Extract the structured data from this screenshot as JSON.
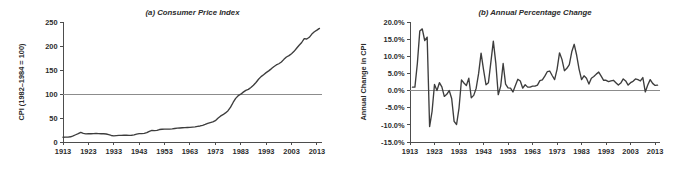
{
  "figure": {
    "background_color": "#ffffff",
    "line_color": "#3d3d3d",
    "axis_color": "#4d4d4d",
    "reference_line_color": "#8c8c8c"
  },
  "chart_data": [
    {
      "type": "line",
      "panel": "a",
      "title": "(a) Consumer Price Index",
      "xlabel": "",
      "ylabel": "CPI (1982–1984 = 100)",
      "xlim": [
        1913,
        2015
      ],
      "ylim": [
        0,
        250
      ],
      "xticks": [
        1913,
        1923,
        1933,
        1943,
        1953,
        1963,
        1973,
        1983,
        1993,
        2003,
        2013
      ],
      "xtick_labels": [
        "1913",
        "1923",
        "1933",
        "1943",
        "1953",
        "1963",
        "1973",
        "1983",
        "1993",
        "2003",
        "2013"
      ],
      "yticks": [
        0,
        50,
        100,
        150,
        200,
        250
      ],
      "ytick_labels": [
        "0",
        "50",
        "100",
        "150",
        "200",
        "250"
      ],
      "grid": false,
      "legend": "none",
      "reference_lines": [
        {
          "axis": "y",
          "value": 100
        }
      ],
      "x": [
        1913,
        1914,
        1915,
        1916,
        1917,
        1918,
        1919,
        1920,
        1921,
        1922,
        1923,
        1924,
        1925,
        1926,
        1927,
        1928,
        1929,
        1930,
        1931,
        1932,
        1933,
        1934,
        1935,
        1936,
        1937,
        1938,
        1939,
        1940,
        1941,
        1942,
        1943,
        1944,
        1945,
        1946,
        1947,
        1948,
        1949,
        1950,
        1951,
        1952,
        1953,
        1954,
        1955,
        1956,
        1957,
        1958,
        1959,
        1960,
        1961,
        1962,
        1963,
        1964,
        1965,
        1966,
        1967,
        1968,
        1969,
        1970,
        1971,
        1972,
        1973,
        1974,
        1975,
        1976,
        1977,
        1978,
        1979,
        1980,
        1981,
        1982,
        1983,
        1984,
        1985,
        1986,
        1987,
        1988,
        1989,
        1990,
        1991,
        1992,
        1993,
        1994,
        1995,
        1996,
        1997,
        1998,
        1999,
        2000,
        2001,
        2002,
        2003,
        2004,
        2005,
        2006,
        2007,
        2008,
        2009,
        2010,
        2011,
        2012,
        2013,
        2014
      ],
      "values": [
        9.9,
        10.0,
        10.1,
        10.9,
        12.8,
        15.1,
        17.3,
        20.0,
        17.9,
        16.8,
        17.1,
        17.1,
        17.5,
        17.7,
        17.4,
        17.2,
        17.2,
        16.7,
        15.2,
        13.6,
        12.9,
        13.4,
        13.7,
        13.9,
        14.4,
        14.1,
        13.9,
        14.0,
        14.7,
        16.3,
        17.3,
        17.6,
        18.0,
        19.5,
        22.3,
        24.0,
        23.8,
        24.1,
        26.0,
        26.6,
        26.8,
        26.9,
        26.8,
        27.2,
        28.1,
        28.9,
        29.2,
        29.6,
        29.9,
        30.3,
        30.6,
        31.0,
        31.5,
        32.5,
        33.4,
        34.8,
        36.7,
        38.8,
        40.5,
        41.8,
        44.4,
        49.3,
        53.8,
        56.9,
        60.6,
        65.2,
        72.6,
        82.4,
        90.9,
        96.5,
        99.6,
        103.9,
        107.6,
        109.6,
        113.6,
        118.3,
        124.0,
        130.7,
        136.2,
        140.3,
        144.5,
        148.2,
        152.4,
        156.9,
        160.5,
        163.0,
        166.6,
        172.2,
        177.1,
        179.9,
        184.0,
        188.9,
        195.3,
        201.6,
        207.3,
        215.3,
        214.5,
        218.1,
        224.9,
        229.6,
        233.0,
        236.7
      ]
    },
    {
      "type": "line",
      "panel": "b",
      "title": "(b) Annual Percentage Change",
      "xlabel": "",
      "ylabel": "Annual Change in CPI",
      "xlim": [
        1913,
        2015
      ],
      "ylim": [
        -15,
        20
      ],
      "xticks": [
        1913,
        1923,
        1933,
        1943,
        1953,
        1963,
        1973,
        1983,
        1993,
        2003,
        2013
      ],
      "xtick_labels": [
        "1913",
        "1923",
        "1933",
        "1943",
        "1953",
        "1963",
        "1973",
        "1983",
        "1993",
        "2003",
        "2013"
      ],
      "yticks": [
        -15,
        -10,
        -5,
        0,
        5,
        10,
        15,
        20
      ],
      "ytick_labels": [
        "-15.0%",
        "-10.0%",
        "-5.0%",
        "0.0%",
        "5.0%",
        "10.0%",
        "15.0%",
        "20.0%"
      ],
      "grid": false,
      "legend": "none",
      "reference_lines": [
        {
          "axis": "y",
          "value": 0
        }
      ],
      "x": [
        1914,
        1915,
        1916,
        1917,
        1918,
        1919,
        1920,
        1921,
        1922,
        1923,
        1924,
        1925,
        1926,
        1927,
        1928,
        1929,
        1930,
        1931,
        1932,
        1933,
        1934,
        1935,
        1936,
        1937,
        1938,
        1939,
        1940,
        1941,
        1942,
        1943,
        1944,
        1945,
        1946,
        1947,
        1948,
        1949,
        1950,
        1951,
        1952,
        1953,
        1954,
        1955,
        1956,
        1957,
        1958,
        1959,
        1960,
        1961,
        1962,
        1963,
        1964,
        1965,
        1966,
        1967,
        1968,
        1969,
        1970,
        1971,
        1972,
        1973,
        1974,
        1975,
        1976,
        1977,
        1978,
        1979,
        1980,
        1981,
        1982,
        1983,
        1984,
        1985,
        1986,
        1987,
        1988,
        1989,
        1990,
        1991,
        1992,
        1993,
        1994,
        1995,
        1996,
        1997,
        1998,
        1999,
        2000,
        2001,
        2002,
        2003,
        2004,
        2005,
        2006,
        2007,
        2008,
        2009,
        2010,
        2011,
        2012,
        2013,
        2014
      ],
      "values": [
        1.0,
        1.0,
        7.9,
        17.4,
        18.0,
        14.6,
        15.6,
        -10.5,
        -6.1,
        1.8,
        0.0,
        2.3,
        1.1,
        -1.7,
        -1.1,
        0.0,
        -2.3,
        -9.0,
        -9.9,
        -5.1,
        3.1,
        2.2,
        1.5,
        3.6,
        -2.1,
        -1.4,
        0.7,
        5.0,
        10.9,
        6.1,
        1.7,
        2.3,
        8.3,
        14.4,
        8.1,
        -1.2,
        1.3,
        7.9,
        1.9,
        0.8,
        0.7,
        -0.4,
        1.5,
        3.3,
        2.8,
        0.7,
        1.7,
        1.0,
        1.0,
        1.3,
        1.3,
        1.6,
        2.9,
        3.1,
        4.2,
        5.5,
        5.7,
        4.4,
        3.2,
        6.2,
        11.0,
        9.1,
        5.8,
        6.5,
        7.6,
        11.3,
        13.5,
        10.3,
        6.2,
        3.2,
        4.3,
        3.6,
        1.9,
        3.6,
        4.1,
        4.8,
        5.4,
        4.2,
        3.0,
        3.0,
        2.6,
        2.8,
        3.0,
        2.3,
        1.6,
        2.2,
        3.4,
        2.8,
        1.6,
        2.3,
        2.7,
        3.4,
        3.2,
        2.8,
        3.8,
        -0.4,
        1.6,
        3.2,
        2.1,
        1.5,
        1.6
      ]
    }
  ]
}
